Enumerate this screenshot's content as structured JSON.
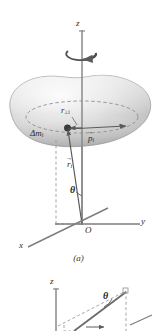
{
  "figure": {
    "background_color": "#ffffff",
    "ink_color": "#4a4a4a",
    "body_fill_light": "#f2f2f2",
    "body_fill_dark": "#b9b9b9",
    "panel_a": {
      "caption": "(a)",
      "axis_z_label": "z",
      "axis_y_label": "y",
      "axis_x_label": "x",
      "origin_label": "O",
      "mass_element_label": "Δm",
      "mass_element_sub": "i",
      "perp_radius_label": "r",
      "perp_radius_sub": "⊥i",
      "momentum_label": "p",
      "momentum_sub": "i",
      "position_label": "r",
      "position_sub": "i",
      "angle_label": "θ",
      "rotation_icon": "rotation-arrow-icon"
    },
    "panel_b": {
      "axis_z_label": "z",
      "angle_label": "θ"
    }
  }
}
